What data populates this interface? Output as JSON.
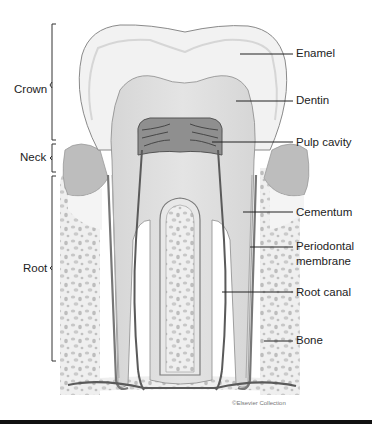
{
  "figure": {
    "credit": "©Elsevier Collection"
  },
  "left_labels": {
    "crown": "Crown",
    "neck": "Neck",
    "root": "Root"
  },
  "right_labels": {
    "enamel": "Enamel",
    "dentin": "Dentin",
    "pulp_cavity": "Pulp cavity",
    "cementum": "Cementum",
    "periodontal_membrane_line1": "Periodontal",
    "periodontal_membrane_line2": "membrane",
    "root_canal": "Root canal",
    "bone": "Bone"
  },
  "colors": {
    "enamel": "#f1f1f1",
    "dentin": "#dcdcdc",
    "pulp": "#8f8f8f",
    "gum": "#b8b8b8",
    "bone_bg": "#ececec",
    "bone_spots": "#c4c4c4",
    "outline": "#6a6a6a",
    "text": "#222222"
  }
}
